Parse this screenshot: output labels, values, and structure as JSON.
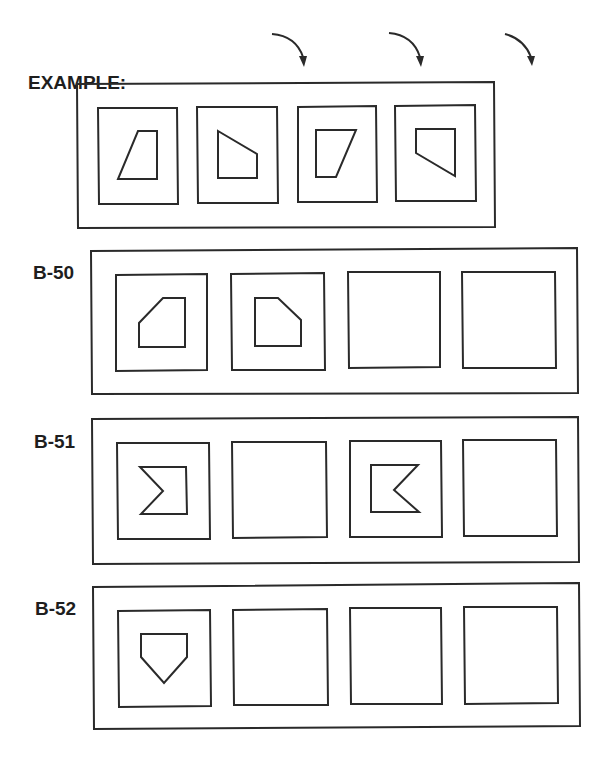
{
  "example": {
    "label": "EXAMPLE:",
    "arrows": [
      "curved-arrow-down-right",
      "curved-arrow-down-right",
      "curved-arrow-down-right"
    ],
    "panels": [
      "trapezoid-slant-left",
      "trapezoid-rotated-90",
      "trapezoid-slant-right",
      "trapezoid-rotated-270"
    ]
  },
  "rows": [
    {
      "id": "B-50",
      "label": "B-50",
      "panels": [
        "pentagon-cut-top-left",
        "pentagon-cut-top-right",
        "blank",
        "blank"
      ]
    },
    {
      "id": "B-51",
      "label": "B-51",
      "panels": [
        "notched-rectangle-left",
        "blank",
        "notched-rectangle-right",
        "blank"
      ]
    },
    {
      "id": "B-52",
      "label": "B-52",
      "panels": [
        "home-plate-pentagon",
        "blank",
        "blank",
        "blank"
      ]
    }
  ],
  "colors": {
    "stroke": "#2a2a2a",
    "background": "#ffffff",
    "text": "#1e1e1e"
  }
}
